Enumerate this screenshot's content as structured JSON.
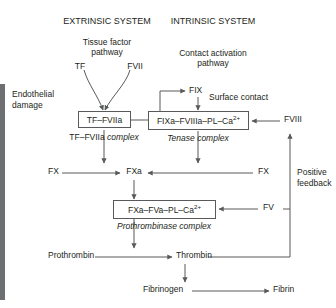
{
  "diagram": {
    "title_left": "EXTRINSIC SYSTEM",
    "title_right": "INTRINSIC SYSTEM",
    "pathway_left_line1": "Tissue factor",
    "pathway_left_line2": "pathway",
    "pathway_right_line1": "Contact activation",
    "pathway_right_line2": "pathway",
    "tf": "TF",
    "fvii": "FVII",
    "endothelial_line1": "Endothelial",
    "endothelial_line2": "damage",
    "fix": "FIX",
    "surface_contact": "Surface contact",
    "box_tf_fviia": "TF–FVIIa",
    "label_tf_fviia_plain": "TF–FVIIa",
    "label_tf_fviia_italic": "complex",
    "box_tenase_main": "FIXa–FVIIIa–PL–Ca",
    "box_tenase_sup": "2+",
    "label_tenase": "Tenase complex",
    "fviii": "FVIII",
    "positive_feedback_line1": "Positive",
    "positive_feedback_line2": "feedback",
    "fx_left": "FX",
    "fxa": "FXa",
    "fx_right": "FX",
    "box_prothrombinase_main": "FXa–FVa–PL–Ca",
    "box_prothrombinase_sup": "2+",
    "label_prothrombinase": "Prothrombinase complex",
    "fv": "FV",
    "prothrombin": "Prothrombin",
    "thrombin": "Thrombin",
    "fibrinogen": "Fibrinogen",
    "fibrin": "Fibrin",
    "colors": {
      "line": "#58595b",
      "text": "#231f20",
      "edge_bar": "#6d6e71",
      "background": "#ffffff"
    }
  }
}
